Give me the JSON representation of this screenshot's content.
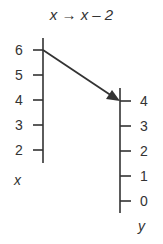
{
  "title": {
    "input_var": "x",
    "arrow": "→",
    "output_expr": "x – 2"
  },
  "left_axis": {
    "variable": "x",
    "ticks": [
      "6",
      "5",
      "4",
      "3",
      "2"
    ]
  },
  "right_axis": {
    "variable": "y",
    "ticks": [
      "4",
      "3",
      "2",
      "1",
      "0"
    ]
  },
  "mapping": {
    "from": "6",
    "to": "4"
  },
  "colors": {
    "ink": "#333333",
    "background": "#ffffff"
  }
}
